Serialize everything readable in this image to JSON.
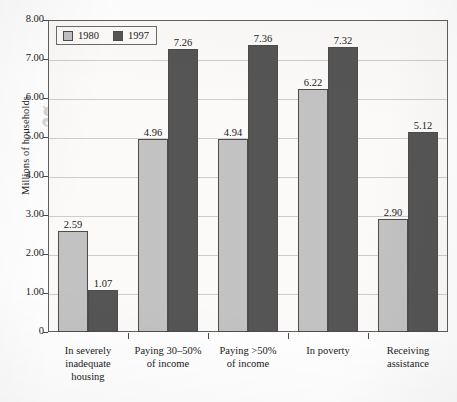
{
  "chart_data": {
    "type": "bar",
    "title": "",
    "xlabel": "",
    "ylabel": "Millions of households",
    "ylim": [
      0,
      8
    ],
    "ytick_labels": [
      "8.00",
      "7.00",
      "6.00",
      "5.00",
      "4.00",
      "3.00",
      "2.00",
      "1.00",
      "0"
    ],
    "ytick_values": [
      8,
      7,
      6,
      5,
      4,
      3,
      2,
      1,
      0
    ],
    "grid": true,
    "legend_position": "top-left",
    "categories": [
      "In severely inadequate housing",
      "Paying 30–50% of income",
      "Paying >50% of income",
      "In poverty",
      "Receiving assistance"
    ],
    "category_lines": [
      [
        "In severely",
        "inadequate",
        "housing"
      ],
      [
        "Paying 30–50%",
        "of income"
      ],
      [
        "Paying >50%",
        "of income"
      ],
      [
        "In poverty"
      ],
      [
        "Receiving",
        "assistance"
      ]
    ],
    "series": [
      {
        "name": "1980",
        "color": "#c2c2c2",
        "values": [
          2.59,
          4.96,
          4.94,
          6.22,
          2.9
        ],
        "labels": [
          "2.59",
          "4.96",
          "4.94",
          "6.22",
          "2.90"
        ]
      },
      {
        "name": "1997",
        "color": "#555555",
        "values": [
          1.07,
          7.26,
          7.36,
          7.32,
          5.12
        ],
        "labels": [
          "1.07",
          "7.26",
          "7.36",
          "7.32",
          "5.12"
        ]
      }
    ]
  },
  "legend": {
    "items": [
      {
        "label": "1980"
      },
      {
        "label": "1997"
      }
    ]
  },
  "watermark": {
    "line1": "Housing Poli",
    "line2": "for Promoting"
  }
}
